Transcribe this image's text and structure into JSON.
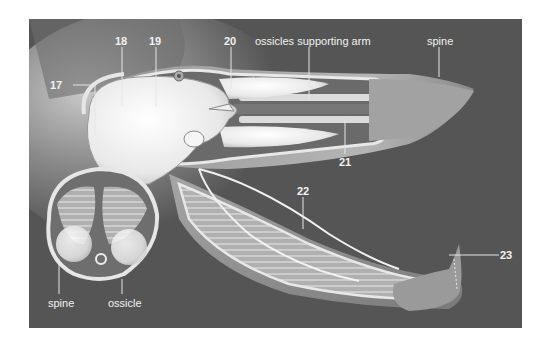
{
  "diagram": {
    "background_color": "#555555",
    "labels": {
      "n17": "17",
      "n18": "18",
      "n19": "19",
      "n20": "20",
      "n21": "21",
      "n22": "22",
      "n23": "23",
      "ossicles": "ossicles supporting arm",
      "spine_top": "spine",
      "spine_bottom": "spine",
      "ossicle": "ossicle"
    }
  }
}
